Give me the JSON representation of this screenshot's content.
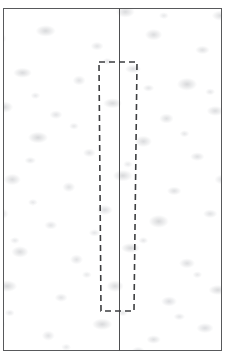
{
  "figure": {
    "title": "",
    "caption": "",
    "background_color": "#ffffff"
  },
  "specimen_frame": {
    "label": "specimen-boundary",
    "x": 3,
    "y": 8,
    "width": 219,
    "height": 343,
    "border_color": "#58595b",
    "border_width_px": 1.4,
    "fill_color": "#fdfdfd"
  },
  "texture": {
    "label": "mottled-granular-surface",
    "base_color": "#ffffff",
    "blob_color_light": "#e4e5e7",
    "blob_color_dark": "#d7d8da",
    "description": "irregular light-gray mottled speckle"
  },
  "centerline": {
    "label": "vertical-center-reference-line",
    "x": 119,
    "top": 8,
    "bottom": 351,
    "color": "#4e4f51",
    "width_px": 1.3,
    "style": "solid"
  },
  "roi": {
    "label": "dashed-region-of-interest",
    "top_left_x": 99,
    "top_right_x": 137,
    "bottom_left_x": 101,
    "bottom_right_x": 134,
    "top_y": 62,
    "bottom_y": 311,
    "color": "#3d3e40",
    "stroke_width_px": 1.6,
    "dash_length_px": 6,
    "dash_gap_px": 4,
    "style": "dashed"
  },
  "chart_data": {
    "type": "diagram",
    "title": "",
    "xlabel": "",
    "ylabel": "",
    "elements": [
      {
        "name": "specimen-boundary",
        "shape": "rectangle",
        "stroke": "solid",
        "color": "#58595b",
        "x": 3,
        "y": 8,
        "width": 219,
        "height": 343
      },
      {
        "name": "vertical-center-reference-line",
        "shape": "line",
        "stroke": "solid",
        "color": "#4e4f51",
        "x1": 119,
        "y1": 8,
        "x2": 119,
        "y2": 351
      },
      {
        "name": "dashed-region-of-interest",
        "shape": "quadrilateral",
        "stroke": "dashed",
        "color": "#3d3e40",
        "points": [
          [
            99,
            62
          ],
          [
            137,
            62
          ],
          [
            134,
            311
          ],
          [
            101,
            311
          ]
        ]
      }
    ]
  }
}
